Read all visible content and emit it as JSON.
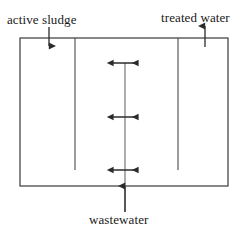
{
  "diagram": {
    "labels": {
      "active_sludge": "active sludge",
      "treated_water": "treated water",
      "wastewater": "wastewater"
    },
    "colors": {
      "stroke": "#3a3a3a",
      "text": "#1a1a1a",
      "background": "#ffffff"
    },
    "tank": {
      "x": 20,
      "y": 38,
      "width": 208,
      "height": 148,
      "stroke_width": 1.2
    },
    "baffles": [
      {
        "name": "left-baffle",
        "x": 75,
        "y_top": 38,
        "y_bottom": 170
      },
      {
        "name": "right-baffle",
        "x": 178,
        "y_top": 38,
        "y_bottom": 170
      }
    ],
    "center_line": {
      "x": 125,
      "y_top": 63,
      "y_bottom": 212
    },
    "flow_arrows": [
      {
        "name": "active-sludge-inlet",
        "direction": "down",
        "x": 49,
        "y_start": 27,
        "y_end": 46
      },
      {
        "name": "treated-water-outlet",
        "direction": "up",
        "x": 205,
        "y_start": 46,
        "y_end": 26
      },
      {
        "name": "wastewater-inlet",
        "direction": "up",
        "x": 125,
        "y_start": 212,
        "y_end": 185
      }
    ],
    "mixing_arrows": [
      {
        "name": "mixing-arrow-top",
        "y": 63,
        "x_left": 112,
        "x_right": 139
      },
      {
        "name": "mixing-arrow-middle",
        "y": 117,
        "x_left": 112,
        "x_right": 139
      },
      {
        "name": "mixing-arrow-bottom",
        "y": 170,
        "x_left": 112,
        "x_right": 139
      }
    ]
  }
}
